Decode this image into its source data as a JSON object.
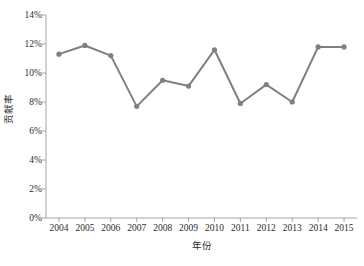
{
  "chart_data": {
    "type": "line",
    "title": "",
    "subtitle": "",
    "xlabel": "年份",
    "ylabel": "贡献率",
    "categories": [
      "2004",
      "2005",
      "2006",
      "2007",
      "2008",
      "2009",
      "2010",
      "2011",
      "2012",
      "2013",
      "2014",
      "2015"
    ],
    "values": [
      11.3,
      11.9,
      11.2,
      7.7,
      9.5,
      9.1,
      11.6,
      7.9,
      9.2,
      8.0,
      11.8,
      11.8
    ],
    "series": [
      {
        "name": "贡献率",
        "values": [
          11.3,
          11.9,
          11.2,
          7.7,
          9.5,
          9.1,
          11.6,
          7.9,
          9.2,
          8.0,
          11.8,
          11.8
        ]
      }
    ],
    "ylim": [
      0,
      14
    ],
    "yticks": [
      0,
      2,
      4,
      6,
      8,
      10,
      12,
      14
    ],
    "ytick_labels": [
      "0%",
      "2%",
      "4%",
      "6%",
      "8%",
      "10%",
      "12%",
      "14%"
    ],
    "xtick_labels": [
      "2004",
      "2005",
      "2006",
      "2007",
      "2008",
      "2009",
      "2010",
      "2011",
      "2012",
      "2013",
      "2014",
      "2015"
    ],
    "grid": false,
    "legend": false,
    "legend_position": "none",
    "line_color": "#808080",
    "marker_color": "#808080",
    "marker": "circle",
    "axis_color": "#a6a6a6",
    "text_color": "#2b2b2b",
    "background": "#ffffff",
    "annotations": []
  },
  "axes": {
    "y_title": "贡献率",
    "x_title": "年份"
  }
}
